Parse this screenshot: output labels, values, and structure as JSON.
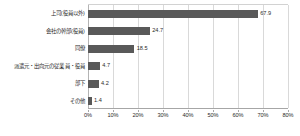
{
  "chart_data": {
    "type": "bar",
    "orientation": "horizontal",
    "title": "",
    "subtitle": "",
    "xlabel": "",
    "ylabel": "",
    "xlim": [
      0,
      80
    ],
    "xticks": [
      0,
      10,
      20,
      30,
      40,
      50,
      60,
      70,
      80
    ],
    "xtick_labels": [
      "0%",
      "10%",
      "20%",
      "30%",
      "40%",
      "50%",
      "60%",
      "70%",
      "80%"
    ],
    "grid": true,
    "legend": false,
    "bar_color": "#595959",
    "categories": [
      "上司(役員以外)",
      "会社の幹部(役員)",
      "同僚",
      "派遣元・出向元の従業員・役員",
      "部下",
      "その他"
    ],
    "values": [
      67.9,
      24.7,
      18.5,
      4.7,
      4.2,
      1.4
    ],
    "value_labels": [
      "67.9",
      "24.7",
      "18.5",
      "4.7",
      "4.2",
      "1.4"
    ]
  }
}
